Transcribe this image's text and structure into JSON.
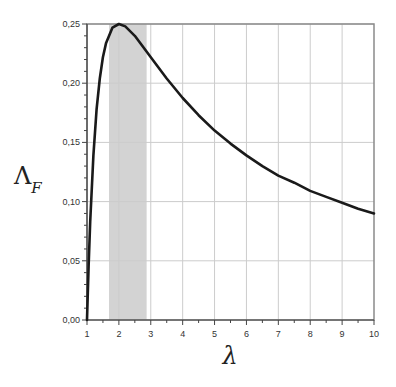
{
  "chart_data": {
    "type": "line",
    "title": "",
    "xlabel": "λ",
    "ylabel": "Λ",
    "ylabel_subscript": "F",
    "xlim": [
      1,
      10
    ],
    "ylim": [
      0.0,
      0.25
    ],
    "x_ticks": [
      1,
      2,
      3,
      4,
      5,
      6,
      7,
      8,
      9,
      10
    ],
    "x_tick_labels": [
      "1",
      "2",
      "3",
      "4",
      "5",
      "6",
      "7",
      "8",
      "9",
      "10"
    ],
    "y_ticks": [
      0.0,
      0.05,
      0.1,
      0.15,
      0.2,
      0.25
    ],
    "y_tick_labels": [
      "0,00",
      "0,05",
      "0,10",
      "0,15",
      "0,20",
      "0,25"
    ],
    "grid": true,
    "legend": null,
    "shaded_band": {
      "x_start": 1.69,
      "x_end": 2.87,
      "color": "#d3d3d3"
    },
    "series": [
      {
        "name": "Λ_F(λ)",
        "color": "#1a1a1a",
        "x": [
          1.0,
          1.05,
          1.1,
          1.2,
          1.3,
          1.4,
          1.5,
          1.6,
          1.8,
          2.0,
          2.2,
          2.5,
          3.0,
          3.5,
          4.0,
          4.5,
          5.0,
          5.5,
          6.0,
          6.5,
          7.0,
          7.5,
          8.0,
          8.5,
          9.0,
          9.5,
          10.0
        ],
        "y": [
          0.0,
          0.045,
          0.083,
          0.139,
          0.178,
          0.204,
          0.222,
          0.234,
          0.247,
          0.25,
          0.248,
          0.24,
          0.222,
          0.204,
          0.1875,
          0.173,
          0.16,
          0.149,
          0.139,
          0.13,
          0.122,
          0.116,
          0.109,
          0.104,
          0.099,
          0.094,
          0.09
        ]
      }
    ]
  },
  "colors": {
    "grid": "#cccccc",
    "frame": "#8a8a8a",
    "axis": "#444444",
    "band": "#d3d3d3",
    "curve": "#1a1a1a"
  }
}
